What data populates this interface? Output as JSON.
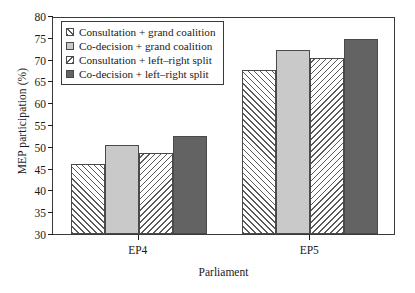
{
  "chart_data": {
    "type": "bar",
    "title": "",
    "xlabel": "Parliament",
    "ylabel": "MEP participation (%)",
    "categories": [
      "EP4",
      "EP5"
    ],
    "ylim": [
      30,
      80
    ],
    "yticks": [
      30,
      35,
      40,
      45,
      50,
      55,
      60,
      65,
      70,
      75,
      80
    ],
    "grid": false,
    "legend_position": "top-left",
    "series": [
      {
        "name": "Consultation + grand coalition",
        "fill": "hatch-forward",
        "color": "#ffffff",
        "values": [
          46.0,
          67.7
        ]
      },
      {
        "name": "Co-decision + grand coalition",
        "fill": "solid-light",
        "color": "#c9c9c9",
        "values": [
          50.4,
          72.3
        ]
      },
      {
        "name": "Consultation + left–right split",
        "fill": "hatch-backward",
        "color": "#ffffff",
        "values": [
          48.6,
          70.4
        ]
      },
      {
        "name": "Co-decision + left–right split",
        "fill": "solid-dark",
        "color": "#636363",
        "values": [
          52.5,
          74.8
        ]
      }
    ]
  }
}
